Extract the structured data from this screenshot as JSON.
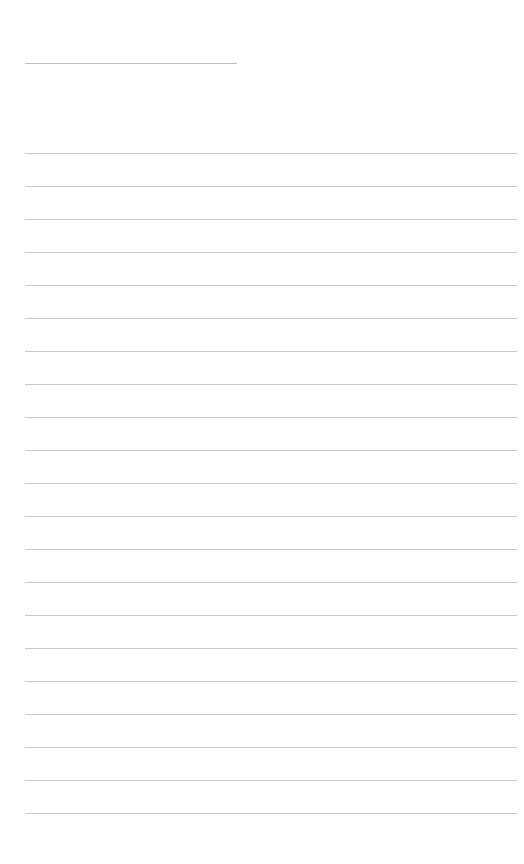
{
  "page": {
    "type": "lined-notebook-page",
    "background_color": "#ffffff",
    "line_color": "#c8c8c8",
    "header_line": {
      "x": 25,
      "y": 63,
      "width": 212,
      "color": "#bdbdbd"
    },
    "ruled_lines": {
      "count": 21,
      "start_x": 25,
      "end_x": 517,
      "first_y": 153,
      "spacing": 33
    },
    "text_content": []
  }
}
